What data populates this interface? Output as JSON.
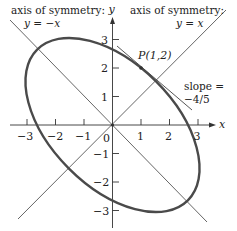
{
  "figure": {
    "equation_implied": "x^2 + xy + y^2 = 7",
    "axes": {
      "x_label": "x",
      "y_label": "y",
      "x_ticks": [
        "−3",
        "−2",
        "−1",
        "1",
        "2",
        "3"
      ],
      "y_ticks": [
        "3",
        "2",
        "1",
        "−1",
        "−2",
        "−3"
      ],
      "origin_label": "0"
    },
    "annotations": {
      "axis_left_title": "axis of symmetry:",
      "axis_left_eq": "y = −x",
      "axis_right_title": "axis of symmetry:",
      "axis_right_eq": "y = x",
      "point_label": "P(1,2)",
      "slope_label": "slope =",
      "slope_value": "−4/5"
    },
    "colors": {
      "curve": "#4a4a4a",
      "axes": "#333333",
      "symmetry_lines": "#555555",
      "text": "#222222"
    }
  }
}
